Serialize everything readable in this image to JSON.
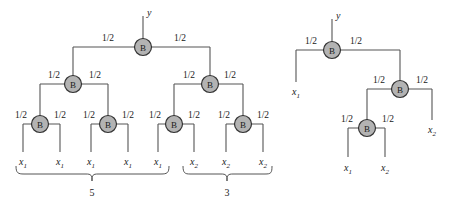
{
  "figure": {
    "title": "",
    "node_label": "B",
    "output_label": "y",
    "weight_label": "1/2",
    "colors": {
      "node_fill": "#b3b3b3",
      "node_stroke": "#333333",
      "edge": "#555555",
      "text": "#1a1a1a",
      "background": "#ffffff"
    }
  },
  "diagrams": [
    {
      "name": "balanced-tree",
      "root": {
        "label": "B",
        "x": 143,
        "y": 47
      },
      "output": {
        "label": "y",
        "x": 147,
        "y": 13
      },
      "nodes": [
        {
          "id": "n0",
          "label": "B",
          "x": 143,
          "y": 47,
          "level": 0
        },
        {
          "id": "n1",
          "label": "B",
          "x": 73,
          "y": 84,
          "level": 1
        },
        {
          "id": "n2",
          "label": "B",
          "x": 210,
          "y": 84,
          "level": 1
        },
        {
          "id": "n3",
          "label": "B",
          "x": 40,
          "y": 124,
          "level": 2
        },
        {
          "id": "n4",
          "label": "B",
          "x": 108,
          "y": 124,
          "level": 2
        },
        {
          "id": "n5",
          "label": "B",
          "x": 174,
          "y": 124,
          "level": 2
        },
        {
          "id": "n6",
          "label": "B",
          "x": 243,
          "y": 124,
          "level": 2
        }
      ],
      "weights": [
        {
          "text": "1/2",
          "x": 108,
          "y": 41
        },
        {
          "text": "1/2",
          "x": 180,
          "y": 41
        },
        {
          "text": "1/2",
          "x": 54,
          "y": 78
        },
        {
          "text": "1/2",
          "x": 95,
          "y": 78
        },
        {
          "text": "1/2",
          "x": 189,
          "y": 78
        },
        {
          "text": "1/2",
          "x": 230,
          "y": 78
        },
        {
          "text": "1/2",
          "x": 21,
          "y": 118
        },
        {
          "text": "1/2",
          "x": 60,
          "y": 118
        },
        {
          "text": "1/2",
          "x": 89,
          "y": 118
        },
        {
          "text": "1/2",
          "x": 128,
          "y": 118
        },
        {
          "text": "1/2",
          "x": 155,
          "y": 118
        },
        {
          "text": "1/2",
          "x": 194,
          "y": 118
        },
        {
          "text": "1/2",
          "x": 224,
          "y": 118
        },
        {
          "text": "1/2",
          "x": 263,
          "y": 118
        }
      ],
      "leaves": [
        {
          "var": "x",
          "sub": "1",
          "x": 23,
          "y": 163
        },
        {
          "var": "x",
          "sub": "1",
          "x": 60,
          "y": 163
        },
        {
          "var": "x",
          "sub": "1",
          "x": 91,
          "y": 163
        },
        {
          "var": "x",
          "sub": "1",
          "x": 128,
          "y": 163
        },
        {
          "var": "x",
          "sub": "1",
          "x": 158,
          "y": 163
        },
        {
          "var": "x",
          "sub": "2",
          "x": 194,
          "y": 163
        },
        {
          "var": "x",
          "sub": "2",
          "x": 226,
          "y": 163
        },
        {
          "var": "x",
          "sub": "2",
          "x": 263,
          "y": 163
        }
      ],
      "braces": [
        {
          "label": "5",
          "x_start": 16,
          "x_end": 169,
          "y": 172,
          "label_x": 92,
          "label_y": 194
        },
        {
          "label": "3",
          "x_start": 183,
          "x_end": 272,
          "y": 172,
          "label_x": 227,
          "label_y": 194
        }
      ]
    },
    {
      "name": "chain-tree",
      "root": {
        "label": "B",
        "x": 332,
        "y": 50
      },
      "output": {
        "label": "y",
        "x": 336,
        "y": 16
      },
      "nodes": [
        {
          "id": "m0",
          "label": "B",
          "x": 332,
          "y": 50,
          "level": 0
        },
        {
          "id": "m1",
          "label": "B",
          "x": 400,
          "y": 89,
          "level": 1
        },
        {
          "id": "m2",
          "label": "B",
          "x": 367,
          "y": 128,
          "level": 2
        }
      ],
      "weights": [
        {
          "text": "1/2",
          "x": 311,
          "y": 44
        },
        {
          "text": "1/2",
          "x": 356,
          "y": 44
        },
        {
          "text": "1/2",
          "x": 379,
          "y": 83
        },
        {
          "text": "1/2",
          "x": 422,
          "y": 83
        },
        {
          "text": "1/2",
          "x": 347,
          "y": 122
        },
        {
          "text": "1/2",
          "x": 388,
          "y": 122
        }
      ],
      "leaves": [
        {
          "var": "x",
          "sub": "1",
          "x": 296,
          "y": 92
        },
        {
          "var": "x",
          "sub": "2",
          "x": 432,
          "y": 130
        },
        {
          "var": "x",
          "sub": "1",
          "x": 348,
          "y": 168
        },
        {
          "var": "x",
          "sub": "2",
          "x": 385,
          "y": 168
        }
      ],
      "braces": []
    }
  ]
}
